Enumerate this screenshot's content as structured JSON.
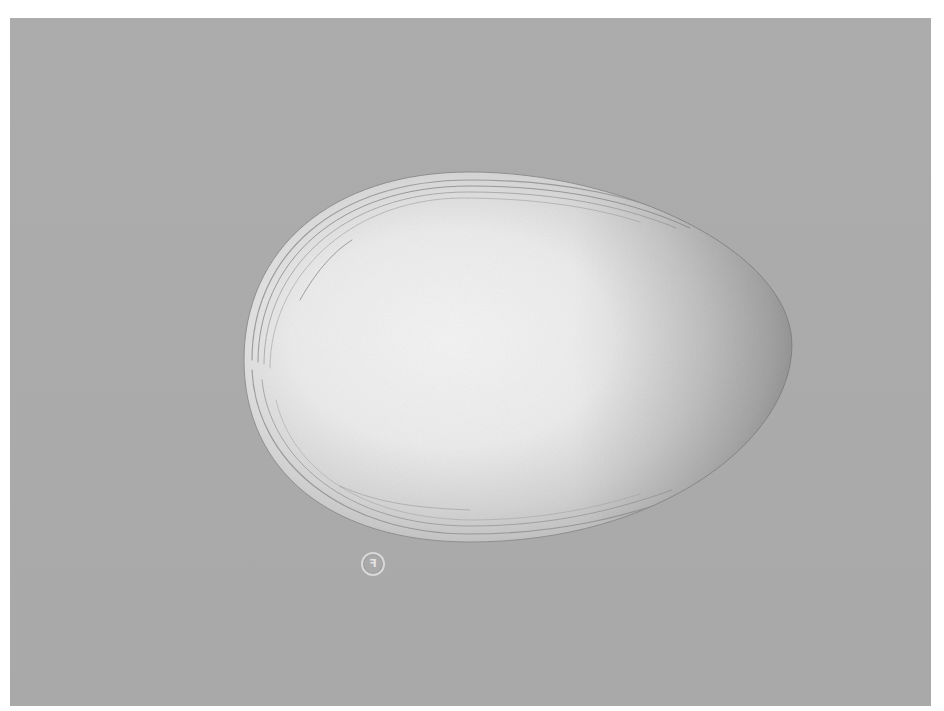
{
  "scene": {
    "description": "Illustration of an egg on a gray background",
    "colors": {
      "page": "#ffffff",
      "background": "#aaaaaa",
      "egg_highlight": "#f2f2f2",
      "egg_mid": "#d4d4d4",
      "egg_shadow": "#9e9e9e",
      "egg_lines": "#7a7a7a"
    },
    "egg": {
      "cx": 518,
      "cy": 357,
      "left": 244,
      "right": 792,
      "top": 172,
      "bottom": 542
    },
    "stamp": {
      "cx": 372,
      "cy": 563,
      "diameter": 22,
      "glyph": "ꟻ"
    }
  }
}
